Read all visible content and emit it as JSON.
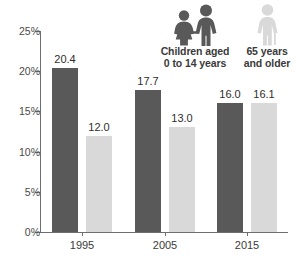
{
  "chart_data": {
    "type": "bar",
    "title": "",
    "subtitle": "",
    "xlabel": "",
    "ylabel": "",
    "categories": [
      "1995",
      "2005",
      "2015"
    ],
    "series": [
      {
        "name": "Children aged 0 to 14 years",
        "color": "#595959",
        "values": [
          20.4,
          17.7,
          16.0
        ],
        "value_labels": [
          "20.4",
          "17.7",
          "16.0"
        ]
      },
      {
        "name": "65 years and older",
        "color": "#d9d9d9",
        "values": [
          12.0,
          13.0,
          16.1
        ],
        "value_labels": [
          "12.0",
          "13.0",
          "16.1"
        ]
      }
    ],
    "ylim": [
      0,
      25
    ],
    "ytick_values": [
      0,
      5,
      10,
      15,
      20,
      25
    ],
    "ytick_labels": [
      "0%",
      "5%",
      "10%",
      "15%",
      "20%",
      "25%"
    ],
    "grid": false,
    "legend_position": "top-right"
  },
  "legend": {
    "children": {
      "label": "Children aged\n0 to 14 years",
      "icon": "children-pair-icon",
      "color": "#595959"
    },
    "elderly": {
      "label": "65 years\nand older",
      "icon": "elderly-person-with-cane-icon",
      "color": "#d9d9d9"
    }
  },
  "axes": {
    "x_labels": [
      "1995",
      "2005",
      "2015"
    ],
    "y_labels": [
      "25%",
      "20%",
      "15%",
      "10%",
      "5%",
      "0%"
    ]
  },
  "colors": {
    "dark_bar": "#595959",
    "light_bar": "#d9d9d9",
    "axis": "#6e6e6e",
    "text": "#3a3a3a",
    "background": "#ffffff"
  }
}
